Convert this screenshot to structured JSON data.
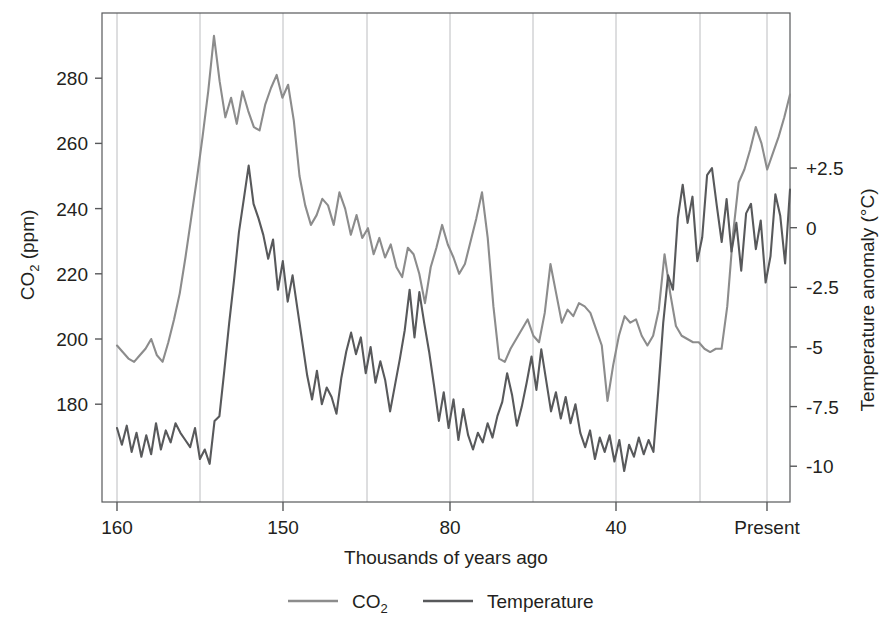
{
  "chart_data": {
    "type": "line",
    "title": "",
    "xlabel": "Thousands of years ago",
    "ylabel_left": "CO2 (ppm)",
    "ylabel_left_parts": {
      "main": "CO",
      "sub": "2",
      "unit": " (ppm)"
    },
    "ylabel_right": "Temperature anomaly (°C)",
    "grid": true,
    "legend_position": "bottom",
    "x_tick_labels": [
      "160",
      "150",
      "80",
      "40",
      "Present"
    ],
    "x_tick_positions_px": [
      117,
      283,
      450,
      616,
      767
    ],
    "gridline_positions_px": [
      117,
      200,
      283,
      367,
      450,
      533,
      616,
      700,
      767
    ],
    "y_left_ticks": [
      280,
      260,
      240,
      220,
      200,
      180
    ],
    "y_left_lim": [
      150,
      300
    ],
    "y_right_ticks": [
      "+2.5",
      "0",
      "-2.5",
      "-5",
      "-7.5",
      "-10"
    ],
    "y_right_values": [
      2.5,
      0,
      -2.5,
      -5,
      -7.5,
      -10
    ],
    "y_right_lim": [
      -11.5,
      9.0
    ],
    "colors": {
      "co2_line": "#8c8c8c",
      "temperature_line": "#58595b",
      "axis": "#58595b",
      "gridline": "#bcbdc0",
      "text": "#231f20",
      "background": "#ffffff"
    },
    "series": [
      {
        "name": "CO2",
        "unit": "ppm",
        "axis": "left",
        "color": "#8c8c8c",
        "values": [
          198,
          196,
          194,
          193,
          195,
          197,
          200,
          195,
          193,
          199,
          206,
          214,
          225,
          237,
          249,
          262,
          276,
          293,
          279,
          268,
          274,
          266,
          276,
          270,
          265,
          264,
          272,
          277,
          281,
          274,
          278,
          267,
          250,
          241,
          235,
          238,
          243,
          241,
          235,
          245,
          240,
          232,
          238,
          231,
          234,
          226,
          231,
          225,
          229,
          222,
          219,
          228,
          226,
          220,
          211,
          222,
          228,
          235,
          229,
          225,
          220,
          223,
          230,
          237,
          245,
          231,
          210,
          194,
          193,
          197,
          200,
          203,
          206,
          201,
          199,
          208,
          223,
          214,
          205,
          209,
          207,
          211,
          210,
          208,
          203,
          198,
          181,
          192,
          201,
          207,
          205,
          206,
          201,
          198,
          201,
          209,
          226,
          214,
          204,
          201,
          200,
          199,
          199,
          197,
          196,
          197,
          197,
          210,
          232,
          248,
          252,
          258,
          265,
          260,
          252,
          257,
          262,
          268,
          275
        ]
      },
      {
        "name": "Temperature",
        "unit": "°C",
        "axis": "right",
        "color": "#58595b",
        "values": [
          -8.4,
          -9.1,
          -8.3,
          -9.4,
          -8.6,
          -9.6,
          -8.7,
          -9.5,
          -8.2,
          -9.3,
          -8.5,
          -9.0,
          -8.2,
          -8.6,
          -8.9,
          -9.2,
          -8.4,
          -9.7,
          -9.3,
          -9.9,
          -8.1,
          -7.9,
          -6.0,
          -4.0,
          -2.2,
          -0.2,
          1.2,
          2.6,
          1.0,
          0.4,
          -0.3,
          -1.3,
          -0.5,
          -2.6,
          -1.4,
          -3.1,
          -2.0,
          -3.4,
          -4.8,
          -6.2,
          -7.2,
          -6.0,
          -7.4,
          -6.7,
          -7.1,
          -7.8,
          -6.3,
          -5.2,
          -4.4,
          -5.3,
          -4.6,
          -6.1,
          -5.0,
          -6.5,
          -5.6,
          -6.4,
          -7.7,
          -6.6,
          -5.5,
          -4.3,
          -2.6,
          -4.6,
          -2.7,
          -4.0,
          -5.2,
          -6.6,
          -8.1,
          -6.9,
          -8.4,
          -7.2,
          -8.9,
          -7.6,
          -8.7,
          -9.3,
          -8.6,
          -9.0,
          -8.2,
          -8.8,
          -7.9,
          -7.3,
          -6.1,
          -7.0,
          -8.3,
          -7.5,
          -6.5,
          -5.4,
          -6.8,
          -5.1,
          -6.4,
          -7.7,
          -6.9,
          -8.0,
          -7.1,
          -8.2,
          -7.4,
          -8.6,
          -9.2,
          -8.5,
          -9.7,
          -8.8,
          -9.4,
          -8.7,
          -9.8,
          -8.9,
          -10.2,
          -9.1,
          -9.6,
          -8.8,
          -9.5,
          -8.9,
          -9.4,
          -6.8,
          -4.0,
          -2.0,
          -2.6,
          0.4,
          1.8,
          0.2,
          1.3,
          -1.4,
          -0.4,
          2.2,
          2.5,
          0.9,
          -0.6,
          1.2,
          -1.0,
          0.2,
          -1.8,
          0.6,
          1.0,
          -0.9,
          0.3,
          -2.3,
          -1.2,
          1.4,
          0.5,
          -1.5,
          1.6
        ]
      }
    ],
    "legend": [
      {
        "label": "CO2",
        "label_main": "CO",
        "label_sub": "2",
        "color": "#8c8c8c"
      },
      {
        "label": "Temperature",
        "label_main": "Temperature",
        "label_sub": "",
        "color": "#58595b"
      }
    ]
  },
  "plot": {
    "left_px": 102,
    "right_px": 790,
    "top_px": 13,
    "bottom_px": 502
  }
}
